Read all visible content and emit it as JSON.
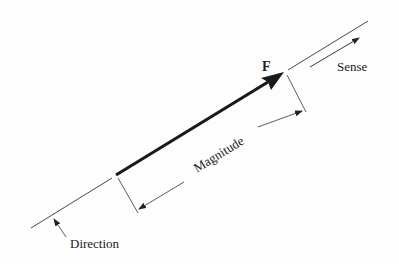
{
  "diagram": {
    "vector_label": "F",
    "labels": {
      "sense": "Sense",
      "magnitude": "Magnitude",
      "direction": "Direction"
    },
    "colors": {
      "ink": "#1a1a1a",
      "thin_line": "#333333",
      "background": "#fdfdfd"
    },
    "geometry": {
      "angle_deg": 31.4,
      "vector": {
        "tail": [
          116,
          175
        ],
        "head": [
          284,
          72
        ]
      },
      "line_of_action_lower": {
        "from": [
          31,
          228
        ],
        "to": [
          112,
          178
        ]
      },
      "line_of_action_upper": {
        "from": [
          288,
          70
        ],
        "to": [
          368,
          21
        ]
      },
      "sense_arrow": {
        "from": [
          310,
          67
        ],
        "to": [
          360,
          37
        ]
      },
      "magnitude_dimension": {
        "from": [
          137,
          210
        ],
        "to": [
          303,
          110
        ]
      },
      "direction_leader": {
        "from": [
          66,
          237
        ],
        "to": [
          53,
          217
        ]
      }
    }
  }
}
